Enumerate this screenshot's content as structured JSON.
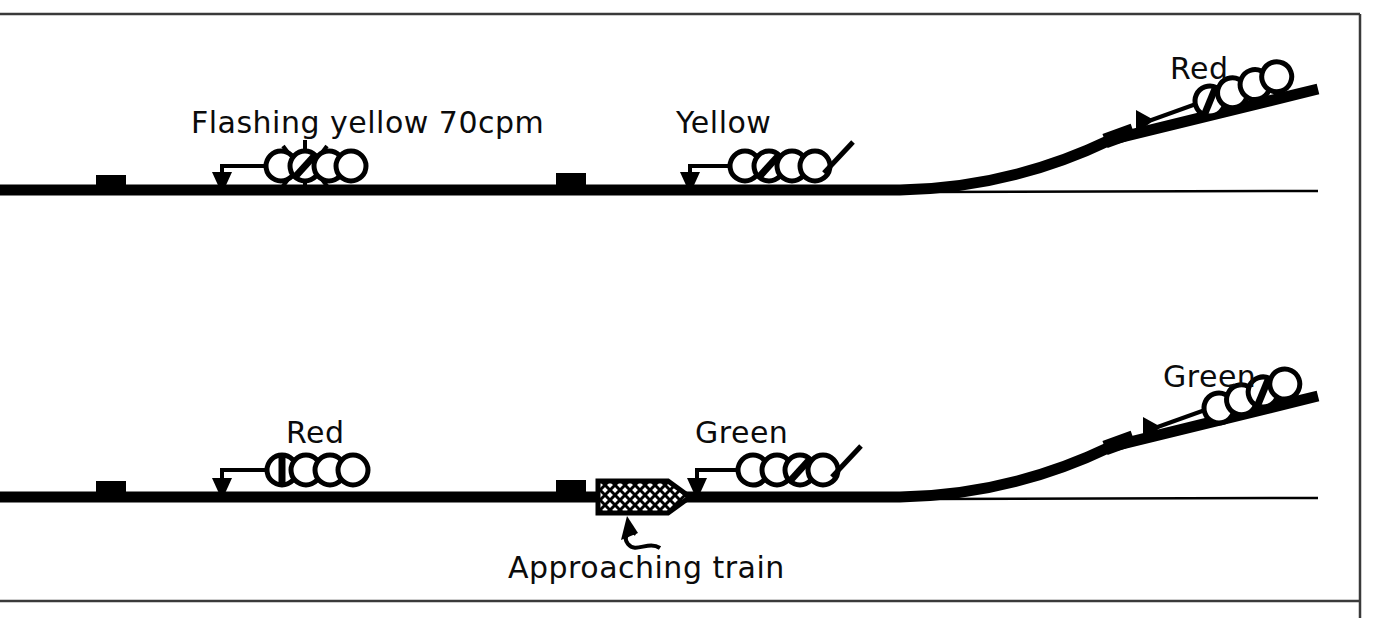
{
  "figure": {
    "kind": "railway-signalling-diagram",
    "background_color": "#ffffff",
    "ink_color": "#000000",
    "border": {
      "present": true,
      "color": "#3a3a3a",
      "top_rule_y": 14,
      "bottom_rule_y": 601,
      "right_rule_x": 1360
    }
  },
  "panels": [
    {
      "id": "upper",
      "name": "upper-scenario",
      "description": "No train present: signals show flashing yellow, yellow and red"
    },
    {
      "id": "lower",
      "name": "lower-scenario",
      "description": "Approaching train present: signals show red, green and green"
    }
  ],
  "labels": {
    "flashing_yellow": "Flashing yellow 70cpm",
    "yellow": "Yellow",
    "red_upper": "Red",
    "red_lower": "Red",
    "green_lower_mid": "Green",
    "green_lower_right": "Green",
    "approaching_train": "Approaching  train"
  },
  "signals": [
    {
      "id": "sig-upper-1",
      "panel": "upper",
      "label_key": "flashing_yellow",
      "aspect": "flashing yellow",
      "flash_rate_cpm": 70,
      "lamp_count": 4,
      "lit_lamp_index": 2,
      "flashing": true,
      "has_route_bar": false,
      "angle_deg": 0,
      "label_x": 191,
      "label_y": 133,
      "head_x": 264,
      "head_y": 166,
      "arrow_x": 222,
      "arrow_y": 192
    },
    {
      "id": "sig-upper-2",
      "panel": "upper",
      "label_key": "yellow",
      "aspect": "yellow",
      "lamp_count": 4,
      "lit_lamp_index": 2,
      "flashing": false,
      "has_route_bar": true,
      "angle_deg": 0,
      "label_x": 676,
      "label_y": 133,
      "head_x": 728,
      "head_y": 166,
      "arrow_x": 690,
      "arrow_y": 192
    },
    {
      "id": "sig-upper-3",
      "panel": "upper",
      "label_key": "red_upper",
      "aspect": "red",
      "lamp_count": 4,
      "lit_lamp_index": 1,
      "flashing": false,
      "has_route_bar": false,
      "angle_deg": -20,
      "label_x": 1170,
      "label_y": 79,
      "head_x": 1194,
      "head_y": 104,
      "arrow_x": 1141,
      "arrow_y": 130
    },
    {
      "id": "sig-lower-1",
      "panel": "lower",
      "label_key": "red_lower",
      "aspect": "red",
      "lamp_count": 4,
      "lit_lamp_index": 1,
      "flashing": false,
      "has_route_bar": false,
      "angle_deg": 0,
      "label_x": 286,
      "label_y": 443,
      "head_x": 265,
      "head_y": 470,
      "arrow_x": 222,
      "arrow_y": 496
    },
    {
      "id": "sig-lower-2",
      "panel": "lower",
      "label_key": "green_lower_mid",
      "aspect": "green",
      "lamp_count": 4,
      "lit_lamp_index": 3,
      "flashing": false,
      "has_route_bar": true,
      "angle_deg": 0,
      "label_x": 695,
      "label_y": 443,
      "head_x": 736,
      "head_y": 470,
      "arrow_x": 697,
      "arrow_y": 496
    },
    {
      "id": "sig-lower-3",
      "panel": "lower",
      "label_key": "green_lower_right",
      "aspect": "green",
      "lamp_count": 4,
      "lit_lamp_index": 3,
      "flashing": false,
      "has_route_bar": false,
      "angle_deg": -20,
      "label_x": 1163,
      "label_y": 387,
      "head_x": 1203,
      "head_y": 408,
      "arrow_x": 1148,
      "arrow_y": 437
    }
  ],
  "track_markers": [
    {
      "id": "mk-u1",
      "panel": "upper",
      "x": 96,
      "y": 175,
      "w": 30,
      "h": 15,
      "angle_deg": 0
    },
    {
      "id": "mk-u2",
      "panel": "upper",
      "x": 556,
      "y": 173,
      "w": 30,
      "h": 15,
      "angle_deg": 0
    },
    {
      "id": "mk-u3",
      "panel": "upper",
      "x": 1106,
      "y": 134,
      "w": 30,
      "h": 15,
      "angle_deg": -20
    },
    {
      "id": "mk-l1",
      "panel": "lower",
      "x": 96,
      "y": 481,
      "w": 30,
      "h": 15,
      "angle_deg": 0
    },
    {
      "id": "mk-l2",
      "panel": "lower",
      "x": 556,
      "y": 479,
      "w": 30,
      "h": 15,
      "angle_deg": 0
    },
    {
      "id": "mk-l3",
      "panel": "lower",
      "x": 1106,
      "y": 441,
      "w": 30,
      "h": 15,
      "angle_deg": -20
    }
  ],
  "train": {
    "id": "approaching-train",
    "panel": "lower",
    "x": 598,
    "y": 481,
    "width": 92,
    "height": 32,
    "nose": "right",
    "fill": "cross-hatch",
    "label_x": 508,
    "label_y": 578,
    "pointer": "curly-arrow"
  },
  "icons": {
    "signal_head": "signal-head-icon",
    "flash": "flash-rays-icon",
    "arrow": "leader-arrow-icon",
    "train": "train-icon",
    "curly_arrow": "curly-arrow-icon",
    "turnout": "turnout-icon"
  }
}
